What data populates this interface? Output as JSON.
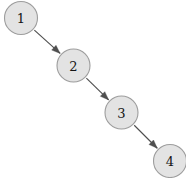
{
  "canvas": {
    "width": 186,
    "height": 178,
    "background": "#ffffff"
  },
  "style": {
    "node_fill": "#e3e3e3",
    "node_stroke": "#9d9d9d",
    "node_radius": 16.5,
    "label_color": "#151515",
    "edge_color": "#4f4f4f"
  },
  "graph": {
    "type": "directed-path",
    "nodes": [
      {
        "id": "1",
        "label": "1",
        "cx": 21,
        "cy": 18
      },
      {
        "id": "2",
        "label": "2",
        "cx": 73.5,
        "cy": 65.5
      },
      {
        "id": "3",
        "label": "3",
        "cx": 121.5,
        "cy": 112.5
      },
      {
        "id": "4",
        "label": "4",
        "cx": 170,
        "cy": 161
      }
    ],
    "edges": [
      {
        "from": "1",
        "to": "2",
        "directed": true
      },
      {
        "from": "2",
        "to": "3",
        "directed": true
      },
      {
        "from": "3",
        "to": "4",
        "directed": true
      }
    ]
  }
}
